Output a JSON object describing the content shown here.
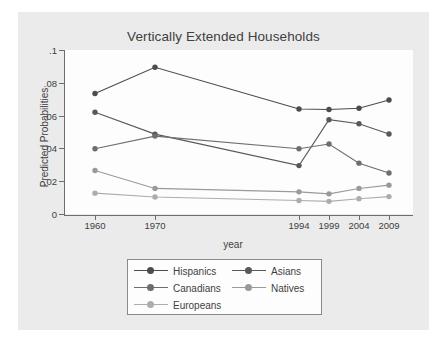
{
  "chart_data": {
    "type": "line",
    "title": "Vertically Extended Households",
    "xlabel": "year",
    "ylabel": "Predicted Probabilities",
    "x": [
      1960,
      1970,
      1994,
      1999,
      2004,
      2009
    ],
    "xtick_labels": [
      "1960",
      "1970",
      "1994",
      "1999",
      "2004",
      "2009"
    ],
    "ytick_labels": [
      "0",
      ".02",
      ".04",
      ".06",
      ".08",
      ".1"
    ],
    "ytick_values": [
      0,
      0.02,
      0.04,
      0.06,
      0.08,
      0.1
    ],
    "xlim": [
      1955,
      2013
    ],
    "ylim": [
      0,
      0.1
    ],
    "grid": false,
    "legend_position": "below-plot",
    "series": [
      {
        "name": "Hispanics",
        "color": "#4c4c4c",
        "values": [
          0.0735,
          0.0895,
          0.064,
          0.0637,
          0.0645,
          0.0695
        ]
      },
      {
        "name": "Asians",
        "color": "#595959",
        "values": [
          0.062,
          0.0487,
          0.0295,
          0.0575,
          0.055,
          0.0488
        ]
      },
      {
        "name": "Canadians",
        "color": "#6e6e6e",
        "values": [
          0.0398,
          0.0475,
          0.0398,
          0.0427,
          0.031,
          0.025
        ]
      },
      {
        "name": "Natives",
        "color": "#9a9a9a",
        "values": [
          0.0265,
          0.0156,
          0.0135,
          0.0123,
          0.0156,
          0.0176
        ]
      },
      {
        "name": "Europeans",
        "color": "#adadad",
        "values": [
          0.0127,
          0.0104,
          0.0082,
          0.0077,
          0.0093,
          0.0106
        ]
      }
    ],
    "legend_entries": [
      {
        "label": "Hispanics",
        "color": "#4c4c4c",
        "col": 0,
        "row": 0
      },
      {
        "label": "Asians",
        "color": "#595959",
        "col": 1,
        "row": 0
      },
      {
        "label": "Canadians",
        "color": "#6e6e6e",
        "col": 0,
        "row": 1
      },
      {
        "label": "Natives",
        "color": "#9a9a9a",
        "col": 1,
        "row": 1
      },
      {
        "label": "Europeans",
        "color": "#adadad",
        "col": 0,
        "row": 2
      }
    ]
  }
}
